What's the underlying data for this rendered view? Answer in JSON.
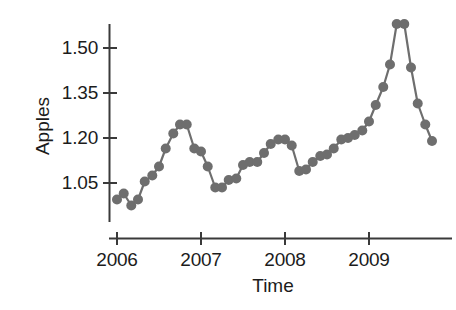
{
  "chart_data": {
    "type": "line",
    "title": "",
    "subtitle": "",
    "xlabel": "Time",
    "ylabel": "Apples",
    "xlim": [
      2005.95,
      2009.85
    ],
    "ylim": [
      0.94,
      1.61
    ],
    "grid": false,
    "legend": null,
    "series_color": "#6e6e6e",
    "axis_color": "#3a3a3a",
    "marker": "circle",
    "marker_size": 5,
    "yticks": [
      1.05,
      1.2,
      1.35,
      1.5
    ],
    "ytick_labels": [
      "1.05",
      "1.20",
      "1.35",
      "1.50"
    ],
    "xticks": [
      2006,
      2007,
      2008,
      2009
    ],
    "xtick_labels": [
      "2006",
      "2007",
      "2008",
      "2009"
    ],
    "x": [
      2006.0,
      2006.08,
      2006.17,
      2006.25,
      2006.33,
      2006.42,
      2006.5,
      2006.58,
      2006.67,
      2006.75,
      2006.83,
      2006.92,
      2007.0,
      2007.08,
      2007.17,
      2007.25,
      2007.33,
      2007.42,
      2007.5,
      2007.58,
      2007.67,
      2007.75,
      2007.83,
      2007.92,
      2008.0,
      2008.08,
      2008.17,
      2008.25,
      2008.33,
      2008.42,
      2008.5,
      2008.58,
      2008.67,
      2008.75,
      2008.83,
      2008.92,
      2009.0,
      2009.08,
      2009.17,
      2009.25,
      2009.33,
      2009.42,
      2009.5,
      2009.58,
      2009.67,
      2009.75
    ],
    "y": [
      0.995,
      1.015,
      0.975,
      0.995,
      1.055,
      1.075,
      1.105,
      1.165,
      1.215,
      1.245,
      1.245,
      1.165,
      1.155,
      1.105,
      1.035,
      1.035,
      1.06,
      1.065,
      1.11,
      1.12,
      1.12,
      1.15,
      1.18,
      1.195,
      1.195,
      1.175,
      1.09,
      1.095,
      1.12,
      1.14,
      1.145,
      1.165,
      1.195,
      1.2,
      1.21,
      1.225,
      1.255,
      1.31,
      1.37,
      1.445,
      1.58,
      1.58,
      1.435,
      1.315,
      1.245,
      1.19
    ],
    "values_note": "Monthly series, 2006-01 through 2009-10"
  },
  "axes": {
    "ylabel": "Apples",
    "xlabel": "Time",
    "ytick_labels": [
      "1.05",
      "1.20",
      "1.35",
      "1.50"
    ],
    "xtick_labels": [
      "2006",
      "2007",
      "2008",
      "2009"
    ]
  }
}
